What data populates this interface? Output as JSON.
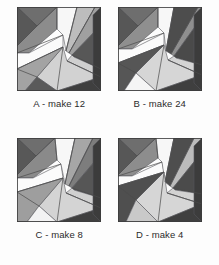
{
  "sheet": {
    "background_color": "#fdfdfd",
    "title": "Quilt block variations"
  },
  "palette": {
    "very_dark": "#3a3a3a",
    "dark": "#4f4f4f",
    "mid_dark": "#6e6e6e",
    "mid": "#8c8c8c",
    "mid_light": "#a8a8a8",
    "light": "#c4c4c4",
    "lighter": "#dcdcdc",
    "near_white": "#f2f2f2",
    "white": "#fbfbfb",
    "seam_line": "#56565a",
    "caption_color": "#2b2b2b"
  },
  "blocks": [
    {
      "id": "A",
      "letter": "A",
      "quantity": 12,
      "caption": "A - make 12",
      "patches": [
        {
          "name": "corner-triangle-top-left-upper",
          "points": "0,0 40,0 20,19",
          "fill": "#6e6e6e"
        },
        {
          "name": "corner-triangle-top-left-left",
          "points": "0,0 20,19 0,39",
          "fill": "#585858"
        },
        {
          "name": "corner-triangle-top-left-lower",
          "points": "0,39 20,19 40,0 40,22 12,46 0,46",
          "fill": "#8c8c8c"
        },
        {
          "name": "wedge-white-upper-left",
          "points": "0,46 12,46 46,28 46,40 0,62",
          "fill": "#fbfbfb"
        },
        {
          "name": "wedge-white-top",
          "points": "40,0 60,0 49,44 46,28 40,22",
          "fill": "#f7f7f7"
        },
        {
          "name": "wedge-light-top-right",
          "points": "60,0 78,0 52,46 49,44",
          "fill": "#bdbdbd"
        },
        {
          "name": "wedge-mid-right-upper",
          "points": "78,0 84,0 84,18 55,48 52,46",
          "fill": "#a0a0a0"
        },
        {
          "name": "wedge-dark-right",
          "points": "84,18 84,62 57,50 55,48",
          "fill": "#575757"
        },
        {
          "name": "wedge-light-center-right",
          "points": "55,48 57,50 84,62 84,70 50,54",
          "fill": "#cfcfcf"
        },
        {
          "name": "wedge-light-lower-center",
          "points": "46,40 50,54 84,70 40,84 20,70",
          "fill": "#d2d2d2"
        },
        {
          "name": "wedge-mid-lower-left",
          "points": "0,62 46,40 20,70 8,84 0,84",
          "fill": "#a3a3a3"
        },
        {
          "name": "wedge-dark-bottom-left",
          "points": "0,84 8,84 20,70 40,84",
          "fill": "#5a5a5a"
        },
        {
          "name": "border-shadow-bottom",
          "points": "0,84 84,84 84,70 40,84",
          "fill": "#3f3f3f"
        },
        {
          "name": "border-shadow-right",
          "points": "84,0 84,84 76,76 76,8",
          "fill": "#3c3c3c"
        }
      ],
      "seams": [
        "M0,0 L20,19",
        "M40,0 L20,19",
        "M0,39 L20,19",
        "M46,28 L0,46",
        "M46,40 L0,62",
        "M40,0 L40,22",
        "M60,0 L49,44",
        "M78,0 L52,46",
        "M84,62 L55,48",
        "M84,70 L50,54",
        "M40,84 L46,40",
        "M20,70 L0,62"
      ]
    },
    {
      "id": "B",
      "letter": "B",
      "quantity": 24,
      "caption": "B - make 24",
      "patches": [
        {
          "name": "corner-triangle-top-left-upper",
          "points": "0,0 40,0 20,19",
          "fill": "#6e6e6e"
        },
        {
          "name": "corner-triangle-top-left-left",
          "points": "0,0 20,19 0,39",
          "fill": "#575757"
        },
        {
          "name": "corner-triangle-top-left-lower",
          "points": "0,39 20,19 40,0 40,20 14,42 0,42",
          "fill": "#8f8f8f"
        },
        {
          "name": "wedge-white-upper-left",
          "points": "0,42 14,42 46,26 46,38 0,56",
          "fill": "#fbfbfb"
        },
        {
          "name": "wedge-white-top",
          "points": "40,0 56,0 48,44 46,26 40,20",
          "fill": "#f7f7f7"
        },
        {
          "name": "wedge-dark-top-right",
          "points": "56,0 80,0 53,47 48,44",
          "fill": "#4d4d4d"
        },
        {
          "name": "wedge-mid-right-upper",
          "points": "80,0 84,0 84,10 56,49 53,47",
          "fill": "#8f8f8f"
        },
        {
          "name": "wedge-dark-right",
          "points": "84,10 84,58 58,51 56,49",
          "fill": "#4a4a4a"
        },
        {
          "name": "wedge-light-center-right",
          "points": "56,49 58,51 84,58 84,68 50,53",
          "fill": "#d4d4d4"
        },
        {
          "name": "wedge-light-lower-center",
          "points": "46,38 50,53 84,68 38,84 18,66",
          "fill": "#d6d6d6"
        },
        {
          "name": "wedge-dark-lower-left",
          "points": "0,56 46,38 18,66 6,84 0,84",
          "fill": "#565656"
        },
        {
          "name": "wedge-white-bottom-left",
          "points": "0,84 6,84 18,66 38,84",
          "fill": "#f5f5f5"
        },
        {
          "name": "border-shadow-bottom",
          "points": "0,84 84,84 84,68 38,84",
          "fill": "#3f3f3f"
        },
        {
          "name": "border-shadow-right",
          "points": "84,0 84,84 76,76 76,8",
          "fill": "#3c3c3c"
        }
      ],
      "seams": [
        "M0,0 L20,19",
        "M40,0 L20,19",
        "M0,39 L20,19",
        "M46,26 L0,42",
        "M46,38 L0,56",
        "M40,0 L40,20",
        "M56,0 L48,44",
        "M80,0 L53,47",
        "M84,58 L56,49",
        "M84,68 L50,53",
        "M38,84 L46,38",
        "M18,66 L0,56"
      ]
    },
    {
      "id": "C",
      "letter": "C",
      "quantity": 8,
      "caption": "C - make 8",
      "patches": [
        {
          "name": "corner-triangle-top-left-upper",
          "points": "0,0 38,0 19,18",
          "fill": "#6e6e6e"
        },
        {
          "name": "corner-triangle-top-left-left",
          "points": "0,0 19,18 0,37",
          "fill": "#585858"
        },
        {
          "name": "corner-triangle-top-left-lower",
          "points": "0,37 19,18 38,0 40,22 16,40 0,40",
          "fill": "#8a8a8a"
        },
        {
          "name": "wedge-white-upper-left",
          "points": "0,40 16,40 44,26 46,40 0,54",
          "fill": "#fbfbfb"
        },
        {
          "name": "wedge-white-top",
          "points": "38,0 58,0 48,46 44,26 40,22",
          "fill": "#f7f7f7"
        },
        {
          "name": "wedge-mid-top-right",
          "points": "58,0 76,0 52,48 48,46",
          "fill": "#a6a6a6"
        },
        {
          "name": "wedge-mid-dark-right-upper",
          "points": "76,0 84,0 84,16 55,50 52,48",
          "fill": "#7d7d7d"
        },
        {
          "name": "wedge-dark-right",
          "points": "84,16 84,60 57,52 55,50",
          "fill": "#565656"
        },
        {
          "name": "wedge-light-center-right",
          "points": "55,50 57,52 84,60 84,70 49,55",
          "fill": "#d0d0d0"
        },
        {
          "name": "wedge-light-lower-center",
          "points": "46,40 49,55 84,70 40,84 22,68",
          "fill": "#d4d4d4"
        },
        {
          "name": "wedge-mid-lower-left",
          "points": "0,54 46,40 22,68 10,84 0,84",
          "fill": "#9e9e9e"
        },
        {
          "name": "wedge-white-bottom-left",
          "points": "0,84 10,84 22,68 40,84",
          "fill": "#f3f3f3"
        },
        {
          "name": "border-shadow-bottom",
          "points": "0,84 84,84 84,70 40,84",
          "fill": "#3f3f3f"
        },
        {
          "name": "border-shadow-right",
          "points": "84,0 84,84 76,76 76,8",
          "fill": "#3c3c3c"
        }
      ],
      "seams": [
        "M0,0 L19,18",
        "M38,0 L19,18",
        "M0,37 L19,18",
        "M44,26 L0,40",
        "M46,40 L0,54",
        "M38,0 L40,22",
        "M58,0 L48,46",
        "M76,0 L52,48",
        "M84,60 L55,50",
        "M84,70 L49,55",
        "M40,84 L46,40",
        "M22,68 L0,54"
      ]
    },
    {
      "id": "D",
      "letter": "D",
      "quantity": 4,
      "caption": "D - make 4",
      "patches": [
        {
          "name": "corner-triangle-top-left-upper",
          "points": "0,0 38,0 19,18",
          "fill": "#6e6e6e"
        },
        {
          "name": "corner-triangle-top-left-left",
          "points": "0,0 19,18 0,37",
          "fill": "#575757"
        },
        {
          "name": "corner-triangle-top-left-lower",
          "points": "0,37 19,18 38,0 40,20 14,38 0,38",
          "fill": "#8d8d8d"
        },
        {
          "name": "wedge-white-upper-left",
          "points": "0,38 14,38 44,24 46,34 0,48",
          "fill": "#fbfbfb"
        },
        {
          "name": "wedge-white-top",
          "points": "38,0 56,0 47,44 44,24 40,20",
          "fill": "#f7f7f7"
        },
        {
          "name": "wedge-dark-top-right",
          "points": "56,0 76,0 52,48 47,44",
          "fill": "#4e4e4e"
        },
        {
          "name": "wedge-light-right-upper",
          "points": "76,0 84,0 84,14 55,50 52,48",
          "fill": "#bcbcbc"
        },
        {
          "name": "wedge-dark-right",
          "points": "84,14 84,56 57,52 55,50",
          "fill": "#4b4b4b"
        },
        {
          "name": "wedge-light-center-right",
          "points": "55,50 57,52 84,56 84,66 49,55",
          "fill": "#d2d2d2"
        },
        {
          "name": "wedge-light-lower-center",
          "points": "46,34 49,55 84,66 40,84 18,62",
          "fill": "#d6d6d6"
        },
        {
          "name": "wedge-dark-lower-left",
          "points": "0,48 46,34 18,62 8,84 0,84",
          "fill": "#4f4f4f"
        },
        {
          "name": "wedge-light-bottom-left",
          "points": "0,84 8,84 18,62 40,84",
          "fill": "#c9c9c9"
        },
        {
          "name": "border-shadow-bottom",
          "points": "0,84 84,84 84,66 40,84",
          "fill": "#3f3f3f"
        },
        {
          "name": "border-shadow-right",
          "points": "84,0 84,84 76,76 76,8",
          "fill": "#3c3c3c"
        }
      ],
      "seams": [
        "M0,0 L19,18",
        "M38,0 L19,18",
        "M0,37 L19,18",
        "M44,24 L0,38",
        "M46,34 L0,48",
        "M38,0 L40,20",
        "M56,0 L47,44",
        "M76,0 L52,48",
        "M84,56 L55,50",
        "M84,66 L49,55",
        "M40,84 L46,34",
        "M18,62 L0,48"
      ]
    }
  ]
}
